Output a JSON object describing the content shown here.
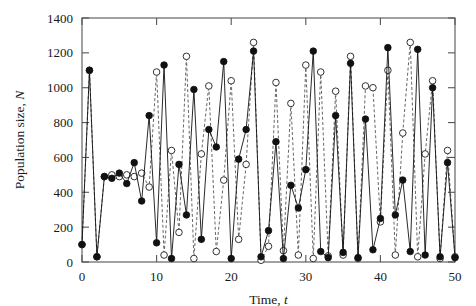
{
  "figure": {
    "background": "#ffffff",
    "frame_color": "#555555"
  },
  "chart_data": {
    "type": "line",
    "title": "",
    "subtitle": "",
    "xlabel_parts": {
      "text": "Time, ",
      "symbol": "t"
    },
    "ylabel_parts": {
      "text": "Population size, ",
      "symbol": "N"
    },
    "xlabel": "Time, t",
    "ylabel": "Population size, N",
    "xlim": [
      0,
      50
    ],
    "ylim": [
      0,
      1400
    ],
    "xticks": [
      0,
      10,
      20,
      30,
      40,
      50
    ],
    "xtick_labels": [
      "0",
      "10",
      "20",
      "30",
      "40",
      "50"
    ],
    "yticks": [
      0,
      200,
      400,
      600,
      800,
      1000,
      1200,
      1400
    ],
    "ytick_labels": [
      "0",
      "200",
      "400",
      "600",
      "800",
      "1000",
      "1200",
      "1400"
    ],
    "grid": false,
    "legend": false,
    "legend_position": "none",
    "tick_direction": "in",
    "frame": "box",
    "x": [
      0,
      1,
      2,
      3,
      4,
      5,
      6,
      7,
      8,
      9,
      10,
      11,
      12,
      13,
      14,
      15,
      16,
      17,
      18,
      19,
      20,
      21,
      22,
      23,
      24,
      25,
      26,
      27,
      28,
      29,
      30,
      31,
      32,
      33,
      34,
      35,
      36,
      37,
      38,
      39,
      40,
      41,
      42,
      43,
      44,
      45,
      46,
      47,
      48,
      49,
      50
    ],
    "series": [
      {
        "name": "series-filled",
        "marker": "filled-circle",
        "linestyle": "solid",
        "color": "#111111",
        "values": [
          100,
          1100,
          30,
          490,
          480,
          510,
          450,
          570,
          350,
          840,
          110,
          1130,
          20,
          560,
          270,
          990,
          130,
          760,
          660,
          1150,
          20,
          590,
          760,
          1210,
          30,
          180,
          690,
          20,
          440,
          310,
          530,
          1210,
          60,
          25,
          840,
          55,
          1140,
          25,
          820,
          70,
          250,
          1230,
          270,
          470,
          60,
          1220,
          40,
          1000,
          30,
          570,
          25
        ]
      },
      {
        "name": "series-open",
        "marker": "open-circle",
        "linestyle": "dashed",
        "color": "#555555",
        "values": [
          100,
          1100,
          30,
          490,
          500,
          490,
          500,
          490,
          510,
          430,
          1090,
          40,
          640,
          170,
          1180,
          20,
          620,
          1010,
          60,
          470,
          1040,
          130,
          560,
          1260,
          10,
          90,
          1030,
          65,
          910,
          40,
          1130,
          20,
          1090,
          35,
          980,
          40,
          1180,
          20,
          1010,
          1000,
          230,
          1100,
          40,
          740,
          1260,
          30,
          620,
          1040,
          20,
          640,
          30
        ]
      }
    ]
  }
}
